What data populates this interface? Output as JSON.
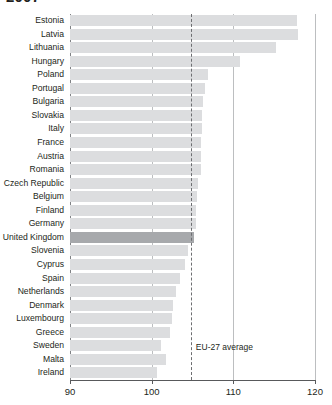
{
  "title": "2007",
  "eu_average": {
    "label": "EU-27 average",
    "value": 104.8
  },
  "axis": {
    "ticks": [
      90,
      100,
      110,
      120
    ],
    "tick_labels": [
      "90",
      "100",
      "110",
      "120"
    ],
    "min": 90,
    "max": 120
  },
  "colors": {
    "bar": "#dcdddf",
    "bar_highlight": "#a7a9ac",
    "grid": "#bcbec0",
    "axis": "#58595b",
    "text": "#231f20"
  },
  "highlight_category": "United Kingdom",
  "chart_data": {
    "type": "bar",
    "orientation": "horizontal",
    "title": "2007",
    "xlabel": "",
    "ylabel": "",
    "xlim": [
      90,
      120
    ],
    "grid": true,
    "legend": "none",
    "categories": [
      "Estonia",
      "Latvia",
      "Lithuania",
      "Hungary",
      "Poland",
      "Portugal",
      "Bulgaria",
      "Slovakia",
      "Italy",
      "France",
      "Austria",
      "Romania",
      "Czech Republic",
      "Belgium",
      "Finland",
      "Germany",
      "United Kingdom",
      "Slovenia",
      "Cyprus",
      "Spain",
      "Netherlands",
      "Denmark",
      "Luxembourg",
      "Greece",
      "Sweden",
      "Malta",
      "Ireland"
    ],
    "values": [
      117.8,
      117.9,
      115.2,
      110.8,
      106.9,
      106.5,
      106.3,
      106.2,
      106.2,
      106.1,
      106.1,
      106.0,
      105.7,
      105.5,
      105.4,
      105.4,
      105.2,
      104.4,
      104.1,
      103.5,
      103.0,
      102.6,
      102.5,
      102.2,
      101.2,
      101.8,
      100.6
    ],
    "annotations": [
      {
        "text": "EU-27 average",
        "x": 104.8,
        "type": "reference-line"
      }
    ]
  }
}
